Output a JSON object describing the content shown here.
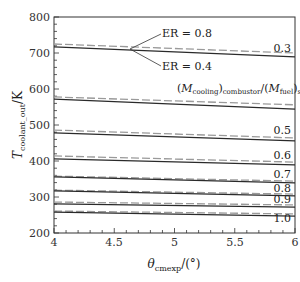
{
  "chart_data": {
    "type": "line",
    "title": "",
    "xlabel": "θ_cmexp/(°)",
    "ylabel": "T_coolant_out/K",
    "xlim": [
      4,
      6
    ],
    "ylim": [
      200,
      800
    ],
    "x_ticks": [
      4,
      4.5,
      5,
      5.5,
      6
    ],
    "x_tick_labels": [
      "4",
      "4.5",
      "5",
      "5.5",
      "6"
    ],
    "y_ticks": [
      200,
      300,
      400,
      500,
      600,
      700,
      800
    ],
    "y_tick_labels": [
      "200",
      "300",
      "400",
      "500",
      "600",
      "700",
      "800"
    ],
    "grid": false,
    "legend": "annotations",
    "x": [
      4,
      6
    ],
    "series": [
      {
        "name": "ER=0.8, ratio=0.3",
        "style": "dashed",
        "values": [
          725,
          700
        ]
      },
      {
        "name": "ER=0.4, ratio=0.3",
        "style": "solid",
        "values": [
          717,
          689
        ]
      },
      {
        "name": "ER=0.8, ratio=0.4",
        "style": "dashed",
        "values": [
          578,
          556
        ]
      },
      {
        "name": "ER=0.4, ratio=0.4",
        "style": "solid",
        "values": [
          572,
          544
        ]
      },
      {
        "name": "ER=0.8, ratio=0.5",
        "style": "dashed",
        "values": [
          486,
          464
        ]
      },
      {
        "name": "ER=0.4, ratio=0.5",
        "style": "solid",
        "values": [
          478,
          456
        ]
      },
      {
        "name": "ER=0.8, ratio=0.6",
        "style": "dashed",
        "values": [
          414,
          397
        ]
      },
      {
        "name": "ER=0.4, ratio=0.6",
        "style": "solid",
        "values": [
          406,
          389
        ]
      },
      {
        "name": "ER=0.8, ratio=0.7",
        "style": "dashed",
        "values": [
          358,
          344
        ]
      },
      {
        "name": "ER=0.4, ratio=0.7",
        "style": "solid",
        "values": [
          356,
          339
        ]
      },
      {
        "name": "ER=0.8, ratio=0.8",
        "style": "dashed",
        "values": [
          319,
          308
        ]
      },
      {
        "name": "ER=0.4, ratio=0.8",
        "style": "solid",
        "values": [
          317,
          303
        ]
      },
      {
        "name": "ER=0.8, ratio=0.9",
        "style": "dashed",
        "values": [
          286,
          278
        ]
      },
      {
        "name": "ER=0.4, ratio=0.9",
        "style": "solid",
        "values": [
          281,
          272
        ]
      },
      {
        "name": "ER=0.8, ratio=1.0",
        "style": "dashed",
        "values": [
          261,
          253
        ]
      },
      {
        "name": "ER=0.4, ratio=1.0",
        "style": "solid",
        "values": [
          258,
          247
        ]
      }
    ],
    "annotations": [
      {
        "text": "ER = 0.8",
        "refers_to": "dashed lines"
      },
      {
        "text": "ER = 0.4",
        "refers_to": "solid lines"
      },
      {
        "text": "(M_cooling)_combustor/(M_fuel)_st = 0.4"
      },
      {
        "text": "0.3"
      },
      {
        "text": "0.5"
      },
      {
        "text": "0.6"
      },
      {
        "text": "0.7"
      },
      {
        "text": "0.8"
      },
      {
        "text": "0.9"
      },
      {
        "text": "1.0"
      }
    ]
  },
  "labels": {
    "er_high": "ER = 0.8",
    "er_low": "ER = 0.4",
    "ratio_prefix_open": "(",
    "ratio_m1": "M",
    "ratio_m1_sub": "cooling",
    "ratio_close1": ")",
    "ratio_sub1": "combustor",
    "ratio_slash": "/(",
    "ratio_m2": "M",
    "ratio_m2_sub": "fuel",
    "ratio_close2": ")",
    "ratio_sub2": "st",
    "ratio_eq": " = 0.4",
    "r03": "0.3",
    "r05": "0.5",
    "r06": "0.6",
    "r07": "0.7",
    "r08": "0.8",
    "r09": "0.9",
    "r10": "1.0",
    "xlabel_theta": "θ",
    "xlabel_sub": "cmexp",
    "xlabel_unit": "/(°)",
    "ylabel_T": "T",
    "ylabel_sub": "coolant_out",
    "ylabel_unit": "/K",
    "xt0": "4",
    "xt1": "4.5",
    "xt2": "5",
    "xt3": "5.5",
    "xt4": "6",
    "yt0": "200",
    "yt1": "300",
    "yt2": "400",
    "yt3": "500",
    "yt4": "600",
    "yt5": "700",
    "yt6": "800"
  }
}
